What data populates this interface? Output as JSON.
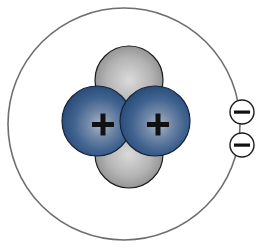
{
  "diagram": {
    "title": "Helium atom (Bohr model)",
    "colors": {
      "background": "#ffffff",
      "orbit": "#6e6e6e",
      "neutron_light": "#d4d4d4",
      "neutron_dark": "#8c8c8c",
      "proton_light": "#9fb0c6",
      "proton_mid": "#4e6f99",
      "proton_dark": "#2c4f7d",
      "outline": "#1c1c1c",
      "electron_fill": "#ffffff",
      "sign": "#111111"
    },
    "orbit": {
      "cx": 124,
      "cy": 124,
      "r": 116
    },
    "neutrons": [
      {
        "label": "neutron",
        "cx": 129,
        "cy": 80,
        "r": 34
      },
      {
        "label": "neutron",
        "cx": 129,
        "cy": 154,
        "r": 34
      }
    ],
    "protons": [
      {
        "label": "proton",
        "sign": "+",
        "cx": 97,
        "cy": 121,
        "r": 35
      },
      {
        "label": "proton",
        "sign": "+",
        "cx": 155,
        "cy": 121,
        "r": 35
      }
    ],
    "electrons": [
      {
        "label": "electron",
        "sign": "−",
        "cx": 242,
        "cy": 112,
        "r": 12
      },
      {
        "label": "electron",
        "sign": "−",
        "cx": 242,
        "cy": 145,
        "r": 12
      }
    ],
    "counts": {
      "protons": 2,
      "neutrons": 2,
      "electrons": 2
    }
  }
}
